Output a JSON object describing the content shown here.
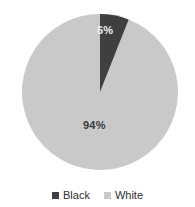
{
  "chart_data": {
    "type": "pie",
    "title": "",
    "subtitle": "",
    "xlabel": "",
    "ylabel": "",
    "grid": false,
    "legend_position": "bottom",
    "categories": [
      "Black",
      "White"
    ],
    "values": [
      6,
      94
    ],
    "value_unit": "percent",
    "data_labels": [
      "6%",
      "94%"
    ],
    "slices": [
      {
        "label": "Black",
        "value": 6,
        "data_label": "6%",
        "color": "#3f3f3f",
        "label_color": "#efefef",
        "start_angle_deg": 0,
        "sweep_angle_deg": 21.6
      },
      {
        "label": "White",
        "value": 94,
        "data_label": "94%",
        "color": "#c9c9c9",
        "label_color": "#3a3a3a",
        "start_angle_deg": 21.6,
        "sweep_angle_deg": 338.4
      }
    ],
    "legend": [
      {
        "label": "Black",
        "color": "#3f3f3f"
      },
      {
        "label": "White",
        "color": "#c9c9c9"
      }
    ],
    "background_color": "#ffffff"
  }
}
